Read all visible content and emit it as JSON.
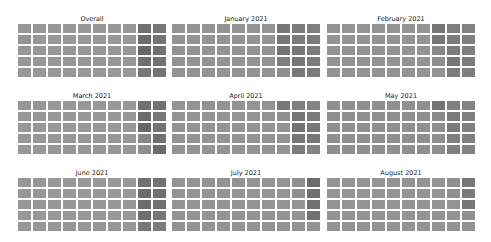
{
  "chart_data": [
    {
      "type": "heatmap",
      "title": "Overall",
      "rows": 5,
      "cols": 10,
      "values": [
        [
          0.42,
          0.42,
          0.42,
          0.42,
          0.42,
          0.42,
          0.42,
          0.42,
          0.62,
          0.58
        ],
        [
          0.44,
          0.42,
          0.42,
          0.42,
          0.42,
          0.42,
          0.42,
          0.42,
          0.64,
          0.6
        ],
        [
          0.42,
          0.42,
          0.42,
          0.42,
          0.42,
          0.42,
          0.42,
          0.42,
          0.66,
          0.62
        ],
        [
          0.42,
          0.42,
          0.42,
          0.42,
          0.42,
          0.42,
          0.42,
          0.42,
          0.62,
          0.6
        ],
        [
          0.42,
          0.42,
          0.42,
          0.42,
          0.42,
          0.42,
          0.42,
          0.42,
          0.58,
          0.6
        ]
      ]
    },
    {
      "type": "heatmap",
      "title": "January 2021",
      "rows": 5,
      "cols": 10,
      "values": [
        [
          0.44,
          0.44,
          0.44,
          0.44,
          0.44,
          0.44,
          0.44,
          0.58,
          0.56,
          0.54
        ],
        [
          0.44,
          0.44,
          0.44,
          0.44,
          0.44,
          0.44,
          0.44,
          0.58,
          0.56,
          0.56
        ],
        [
          0.44,
          0.44,
          0.44,
          0.44,
          0.44,
          0.44,
          0.44,
          0.6,
          0.58,
          0.56
        ],
        [
          0.44,
          0.44,
          0.44,
          0.44,
          0.44,
          0.44,
          0.44,
          0.54,
          0.58,
          0.56
        ],
        [
          0.44,
          0.44,
          0.44,
          0.44,
          0.44,
          0.44,
          0.44,
          0.46,
          0.58,
          0.56
        ]
      ]
    },
    {
      "type": "heatmap",
      "title": "February 2021",
      "rows": 5,
      "cols": 10,
      "values": [
        [
          0.44,
          0.44,
          0.44,
          0.44,
          0.44,
          0.44,
          0.44,
          0.58,
          0.54,
          0.52
        ],
        [
          0.44,
          0.44,
          0.44,
          0.44,
          0.44,
          0.44,
          0.44,
          0.58,
          0.56,
          0.54
        ],
        [
          0.44,
          0.44,
          0.44,
          0.44,
          0.44,
          0.44,
          0.44,
          0.5,
          0.56,
          0.54
        ],
        [
          0.44,
          0.44,
          0.44,
          0.44,
          0.44,
          0.44,
          0.44,
          0.46,
          0.58,
          0.56
        ],
        [
          0.44,
          0.44,
          0.44,
          0.44,
          0.44,
          0.44,
          0.44,
          0.44,
          0.56,
          0.54
        ]
      ]
    },
    {
      "type": "heatmap",
      "title": "March 2021",
      "rows": 5,
      "cols": 10,
      "values": [
        [
          0.42,
          0.42,
          0.42,
          0.42,
          0.42,
          0.42,
          0.42,
          0.42,
          0.62,
          0.6
        ],
        [
          0.42,
          0.42,
          0.42,
          0.42,
          0.42,
          0.42,
          0.42,
          0.42,
          0.64,
          0.58
        ],
        [
          0.42,
          0.42,
          0.42,
          0.42,
          0.42,
          0.42,
          0.42,
          0.42,
          0.66,
          0.6
        ],
        [
          0.42,
          0.42,
          0.42,
          0.42,
          0.42,
          0.42,
          0.42,
          0.42,
          0.5,
          0.62
        ],
        [
          0.42,
          0.42,
          0.42,
          0.42,
          0.42,
          0.42,
          0.42,
          0.42,
          0.46,
          0.64
        ]
      ]
    },
    {
      "type": "heatmap",
      "title": "April 2021",
      "rows": 5,
      "cols": 10,
      "values": [
        [
          0.44,
          0.44,
          0.44,
          0.44,
          0.44,
          0.44,
          0.44,
          0.58,
          0.54,
          0.52
        ],
        [
          0.44,
          0.44,
          0.44,
          0.44,
          0.44,
          0.44,
          0.44,
          0.46,
          0.58,
          0.56
        ],
        [
          0.44,
          0.44,
          0.44,
          0.44,
          0.44,
          0.44,
          0.44,
          0.44,
          0.6,
          0.58
        ],
        [
          0.44,
          0.44,
          0.44,
          0.44,
          0.44,
          0.44,
          0.44,
          0.44,
          0.58,
          0.58
        ],
        [
          0.44,
          0.44,
          0.44,
          0.44,
          0.44,
          0.44,
          0.44,
          0.44,
          0.56,
          0.52
        ]
      ]
    },
    {
      "type": "heatmap",
      "title": "May 2021",
      "rows": 5,
      "cols": 10,
      "values": [
        [
          0.46,
          0.46,
          0.46,
          0.46,
          0.46,
          0.46,
          0.46,
          0.6,
          0.54,
          0.52
        ],
        [
          0.46,
          0.46,
          0.46,
          0.46,
          0.46,
          0.46,
          0.46,
          0.48,
          0.56,
          0.54
        ],
        [
          0.46,
          0.46,
          0.46,
          0.46,
          0.46,
          0.46,
          0.46,
          0.46,
          0.56,
          0.54
        ],
        [
          0.46,
          0.46,
          0.46,
          0.46,
          0.46,
          0.46,
          0.46,
          0.46,
          0.54,
          0.54
        ],
        [
          0.46,
          0.46,
          0.46,
          0.46,
          0.46,
          0.46,
          0.46,
          0.46,
          0.54,
          0.52
        ]
      ]
    },
    {
      "type": "heatmap",
      "title": "June 2021",
      "rows": 5,
      "cols": 10,
      "values": [
        [
          0.42,
          0.42,
          0.42,
          0.42,
          0.42,
          0.42,
          0.42,
          0.42,
          0.62,
          0.6
        ],
        [
          0.42,
          0.42,
          0.42,
          0.42,
          0.42,
          0.42,
          0.42,
          0.42,
          0.64,
          0.62
        ],
        [
          0.42,
          0.42,
          0.42,
          0.42,
          0.42,
          0.42,
          0.42,
          0.42,
          0.64,
          0.62
        ],
        [
          0.42,
          0.42,
          0.42,
          0.42,
          0.42,
          0.42,
          0.42,
          0.42,
          0.62,
          0.58
        ],
        [
          0.42,
          0.42,
          0.42,
          0.42,
          0.42,
          0.42,
          0.42,
          0.42,
          0.58,
          0.56
        ]
      ]
    },
    {
      "type": "heatmap",
      "title": "July 2021",
      "rows": 5,
      "cols": 10,
      "values": [
        [
          0.44,
          0.44,
          0.44,
          0.44,
          0.44,
          0.44,
          0.44,
          0.44,
          0.46,
          0.64
        ],
        [
          0.44,
          0.44,
          0.44,
          0.44,
          0.44,
          0.44,
          0.44,
          0.44,
          0.46,
          0.62
        ],
        [
          0.44,
          0.44,
          0.44,
          0.44,
          0.44,
          0.44,
          0.44,
          0.44,
          0.44,
          0.62
        ],
        [
          0.44,
          0.44,
          0.44,
          0.44,
          0.44,
          0.44,
          0.44,
          0.44,
          0.44,
          0.6
        ],
        [
          0.44,
          0.44,
          0.44,
          0.44,
          0.44,
          0.44,
          0.44,
          0.44,
          0.44,
          0.44
        ]
      ]
    },
    {
      "type": "heatmap",
      "title": "August 2021",
      "rows": 5,
      "cols": 10,
      "values": [
        [
          0.44,
          0.44,
          0.44,
          0.44,
          0.44,
          0.44,
          0.44,
          0.44,
          0.46,
          0.58
        ],
        [
          0.44,
          0.44,
          0.44,
          0.44,
          0.44,
          0.44,
          0.44,
          0.44,
          0.46,
          0.56
        ],
        [
          0.44,
          0.44,
          0.44,
          0.44,
          0.44,
          0.44,
          0.44,
          0.44,
          0.44,
          0.58
        ],
        [
          0.44,
          0.44,
          0.44,
          0.44,
          0.44,
          0.44,
          0.44,
          0.44,
          0.44,
          0.46
        ],
        [
          0.44,
          0.44,
          0.44,
          0.44,
          0.44,
          0.44,
          0.44,
          0.44,
          0.44,
          0.44
        ]
      ]
    }
  ],
  "panels": [
    {
      "title": "Overall"
    },
    {
      "title": "January 2021"
    },
    {
      "title": "February 2021"
    },
    {
      "title": "March 2021"
    },
    {
      "title": "April 2021"
    },
    {
      "title": "May 2021"
    },
    {
      "title": "June 2021"
    },
    {
      "title": "July 2021"
    },
    {
      "title": "August 2021"
    }
  ],
  "colors": {
    "cell_light": "#a3a3a3",
    "cell_dark": "#6e6e6e",
    "background": "#ffffff",
    "title_text": "#222222"
  }
}
